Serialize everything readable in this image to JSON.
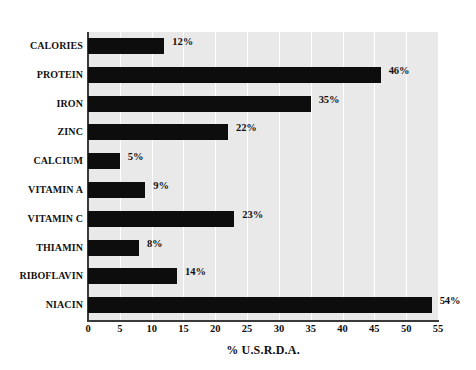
{
  "chart_data": {
    "type": "bar",
    "orientation": "horizontal",
    "title": "",
    "xlabel": "% U.S.R.D.A.",
    "ylabel": "",
    "xlim": [
      0,
      55
    ],
    "xticks": [
      0,
      5,
      10,
      15,
      20,
      25,
      30,
      35,
      40,
      45,
      50,
      55
    ],
    "xtick_labels": [
      "0",
      "5",
      "10",
      "15",
      "20",
      "25",
      "30",
      "35",
      "40",
      "45",
      "50",
      "55"
    ],
    "grid": "vertical-white-gridlines",
    "legend": "none",
    "categories": [
      "CALORIES",
      "PROTEIN",
      "IRON",
      "ZINC",
      "CALCIUM",
      "VITAMIN A",
      "VITAMIN C",
      "THIAMIN",
      "RIBOFLAVIN",
      "NIACIN"
    ],
    "values": [
      12,
      46,
      35,
      22,
      5,
      9,
      23,
      8,
      14,
      54
    ],
    "value_labels": [
      "12%",
      "46%",
      "35%",
      "22%",
      "5%",
      "9%",
      "23%",
      "8%",
      "14%",
      "54%"
    ],
    "bar_color": "#0d0d0d",
    "plot_background_color": "#e9e9e9",
    "gridline_color": "#ffffff",
    "axis_color": "#3a3a3a"
  }
}
